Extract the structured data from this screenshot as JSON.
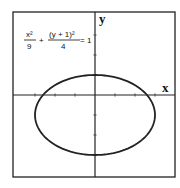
{
  "chart_data": {
    "type": "line",
    "title": "",
    "equation": {
      "term1_num": "x²",
      "term1_den": "9",
      "plus": "+",
      "term2_num": "(y + 1)²",
      "term2_den": "4",
      "rhs": "= 1"
    },
    "xlabel": "x",
    "ylabel": "y",
    "xlim": [
      -4,
      4
    ],
    "ylim": [
      -4,
      4
    ],
    "x_ticks": [
      -3,
      -2,
      -1,
      1,
      2,
      3
    ],
    "y_ticks": [
      -3,
      -2,
      -1,
      1,
      2,
      3
    ],
    "grid": false,
    "series": [
      {
        "name": "ellipse",
        "kind": "ellipse",
        "center": [
          0,
          -1
        ],
        "semi_axis_x": 3,
        "semi_axis_y": 2
      }
    ]
  }
}
